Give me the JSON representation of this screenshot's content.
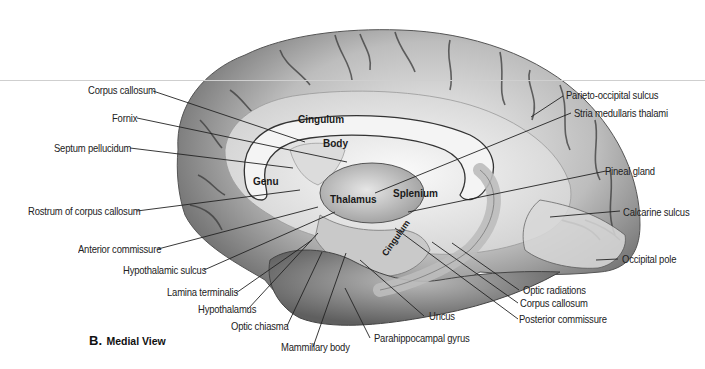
{
  "figure": {
    "caption_letter": "B.",
    "caption_title": "Medial View"
  },
  "inner_labels": {
    "cingulum_top": "Cingulum",
    "body": "Body",
    "genu": "Genu",
    "thalamus": "Thalamus",
    "splenium": "Splenium",
    "cingulum_bottom": "Cingulum"
  },
  "left_labels": [
    {
      "text": "Corpus callosum"
    },
    {
      "text": "Fornix"
    },
    {
      "text": "Septum pellucidum"
    },
    {
      "text": "Rostrum of corpus callosum"
    },
    {
      "text": "Anterior commissure"
    },
    {
      "text": "Hypothalamic sulcus"
    },
    {
      "text": "Lamina terminalis"
    },
    {
      "text": "Hypothalamus"
    },
    {
      "text": "Optic chiasma"
    },
    {
      "text": "Mammillary body"
    }
  ],
  "right_labels": [
    {
      "text": "Parieto-occipital sulcus"
    },
    {
      "text": "Stria medullaris thalami"
    },
    {
      "text": "Pineal gland"
    },
    {
      "text": "Calcarine sulcus"
    },
    {
      "text": "Occipital pole"
    },
    {
      "text": "Optic radiations"
    },
    {
      "text": "Corpus callosum"
    },
    {
      "text": "Posterior commissure"
    },
    {
      "text": "Uncus"
    },
    {
      "text": "Parahippocampal gyrus"
    }
  ]
}
